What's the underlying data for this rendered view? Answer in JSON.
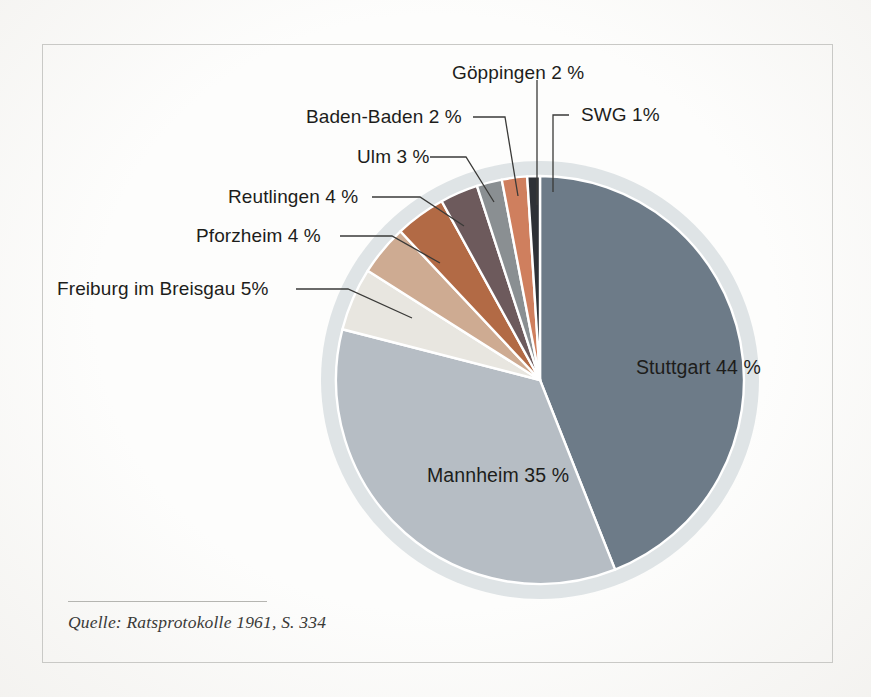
{
  "figure": {
    "source_note": "Quelle: Ratsprotokolle 1961, S. 334",
    "background_color": "#fdfdfc",
    "frame_color": "#c9c9c6",
    "ring_color": "#dfe4e6",
    "label_color": "#1d1d1b",
    "leader_line_color": "#3a3a38",
    "slice_divider_color": "#ffffff"
  },
  "chart_data": {
    "type": "pie",
    "title": "",
    "subtitle": "",
    "xlabel": "",
    "ylabel": "",
    "grid": false,
    "legend_position": "none",
    "start_angle_deg": 0,
    "direction": "clockwise",
    "unit": "%",
    "total": 100,
    "categories": [
      "Stuttgart",
      "Mannheim",
      "Freiburg im Breisgau",
      "Pforzheim",
      "Reutlingen",
      "Ulm",
      "Baden-Baden",
      "Göppingen",
      "SWG"
    ],
    "values": [
      44,
      35,
      5,
      4,
      4,
      3,
      2,
      2,
      1
    ],
    "colors": [
      "#6d7b88",
      "#b6bdc4",
      "#e8e6e0",
      "#ceab92",
      "#b26a45",
      "#6d5a5c",
      "#8a8f92",
      "#cf7f5e",
      "#2e3136"
    ],
    "labels": [
      "Stuttgart 44 %",
      "Mannheim 35 %",
      "Freiburg im Breisgau 5%",
      "Pforzheim 4 %",
      "Reutlingen 4 %",
      "Ulm 3 %",
      "Baden-Baden 2 %",
      "Göppingen 2 %",
      "SWG 1%"
    ],
    "label_placement": [
      "inside",
      "inside",
      "callout",
      "callout",
      "callout",
      "callout",
      "callout",
      "callout",
      "callout"
    ]
  },
  "inside_labels": [
    {
      "text": "Stuttgart 44 %",
      "x": 636,
      "y": 356
    },
    {
      "text": "Mannheim 35 %",
      "x": 427,
      "y": 464
    }
  ],
  "callouts": [
    {
      "name": "freiburg-im-breisgau",
      "text": "Freiburg im Breisgau 5%",
      "x": 57,
      "y": 278,
      "line": "M 296 289 L 348 289 L 412 318"
    },
    {
      "name": "pforzheim",
      "text": "Pforzheim 4 %",
      "x": 196,
      "y": 225,
      "line": "M 340 236 L 392 236 L 440 263"
    },
    {
      "name": "reutlingen",
      "text": "Reutlingen 4 %",
      "x": 228,
      "y": 186,
      "line": "M 372 197 L 420 197 L 464 226"
    },
    {
      "name": "ulm",
      "text": "Ulm 3 %",
      "x": 357,
      "y": 146,
      "line": "M 430 157 L 466 157 L 494 202"
    },
    {
      "name": "baden-baden",
      "text": "Baden-Baden 2 %",
      "x": 306,
      "y": 106,
      "line": "M 473 117 L 505 117 L 518 196"
    },
    {
      "name": "goeppingen",
      "text": "Göppingen 2 %",
      "x": 452,
      "y": 62,
      "line": "M 537 80 L 537 205"
    },
    {
      "name": "swg",
      "text": "SWG 1%",
      "x": 581,
      "y": 104,
      "line": "M 569 115 L 553 115 L 553 192"
    }
  ]
}
